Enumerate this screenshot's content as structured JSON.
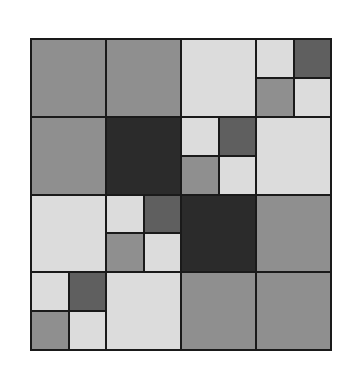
{
  "colors": {
    "border": "#1a1a1a",
    "dark": "#2b2b2b",
    "darkgray": "#5f5f5f",
    "mid": "#8f8f8f",
    "light": "#dcdcdc"
  },
  "quad_pattern": [
    "light",
    "darkgray",
    "mid",
    "light"
  ],
  "grid": [
    [
      "mid",
      "mid",
      "light",
      "quad"
    ],
    [
      "mid",
      "dark",
      "quad",
      "light"
    ],
    [
      "light",
      "quad",
      "dark",
      "mid"
    ],
    [
      "quad",
      "light",
      "mid",
      "mid"
    ]
  ]
}
